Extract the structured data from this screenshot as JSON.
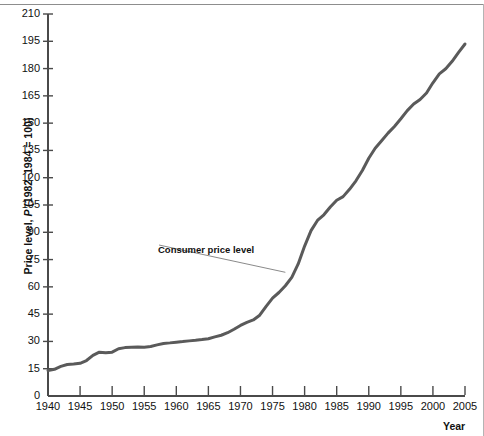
{
  "figure": {
    "y_axis_label": "Price level, P (1982–1984 = 100)",
    "y_axis_label_prefix": "Price level, ",
    "y_axis_label_italic": "P",
    "y_axis_label_suffix": " (1982–1984 = 100)",
    "x_axis_label": "Year",
    "series_annotation": "Consumer price level",
    "line_color": "#5a5a5a",
    "leader_color": "#8a8a8a",
    "axis_color": "#4a4a4a",
    "text_color": "#111111"
  },
  "chart_data": {
    "type": "line",
    "title": "",
    "subtitle": "",
    "xlabel": "Year",
    "ylabel": "Price level, P (1982–1984 = 100)",
    "xlim": [
      1940,
      2005
    ],
    "ylim": [
      0,
      210
    ],
    "grid": false,
    "legend": "none",
    "annotations": [
      {
        "text": "Consumer price level",
        "text_x": 1957,
        "text_y": 83,
        "points_to_x": 1977,
        "points_to_y": 68
      }
    ],
    "xticks": [
      1940,
      1945,
      1950,
      1955,
      1960,
      1965,
      1970,
      1975,
      1980,
      1985,
      1990,
      1995,
      2000,
      2005
    ],
    "yticks": [
      0,
      15,
      30,
      45,
      60,
      75,
      90,
      105,
      120,
      135,
      150,
      165,
      180,
      195,
      210
    ],
    "series": [
      {
        "name": "Consumer price level",
        "x": [
          1940,
          1941,
          1942,
          1943,
          1944,
          1945,
          1946,
          1947,
          1948,
          1949,
          1950,
          1951,
          1952,
          1953,
          1954,
          1955,
          1956,
          1957,
          1958,
          1959,
          1960,
          1961,
          1962,
          1963,
          1964,
          1965,
          1966,
          1967,
          1968,
          1969,
          1970,
          1971,
          1972,
          1973,
          1974,
          1975,
          1976,
          1977,
          1978,
          1979,
          1980,
          1981,
          1982,
          1983,
          1984,
          1985,
          1986,
          1987,
          1988,
          1989,
          1990,
          1991,
          1992,
          1993,
          1994,
          1995,
          1996,
          1997,
          1998,
          1999,
          2000,
          2001,
          2002,
          2003,
          2004,
          2005
        ],
        "values": [
          14.0,
          14.7,
          16.3,
          17.3,
          17.6,
          18.0,
          19.5,
          22.3,
          24.1,
          23.8,
          24.1,
          26.0,
          26.6,
          26.8,
          26.9,
          26.8,
          27.2,
          28.1,
          28.9,
          29.2,
          29.6,
          29.9,
          30.3,
          30.6,
          31.0,
          31.5,
          32.5,
          33.4,
          34.8,
          36.7,
          38.8,
          40.5,
          41.8,
          44.4,
          49.3,
          53.8,
          56.9,
          60.6,
          65.2,
          72.6,
          82.4,
          90.9,
          96.5,
          99.6,
          103.9,
          107.6,
          109.6,
          113.6,
          118.3,
          124.0,
          130.7,
          136.2,
          140.3,
          144.5,
          148.2,
          152.4,
          156.9,
          160.5,
          163.0,
          166.6,
          172.2,
          177.1,
          179.9,
          184.0,
          188.9,
          193.5
        ]
      }
    ]
  }
}
